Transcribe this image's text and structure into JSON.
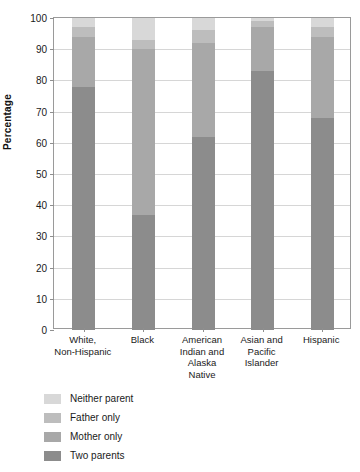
{
  "chart_data": {
    "type": "bar",
    "subtype": "stacked-bar",
    "title": "",
    "xlabel": "",
    "ylabel": "Percentage",
    "ylim": [
      0,
      100
    ],
    "ytick_step": 10,
    "yticks": [
      0,
      10,
      20,
      30,
      40,
      50,
      60,
      70,
      80,
      90,
      100
    ],
    "grid": true,
    "legend_position": "below-left",
    "stack_order_bottom_to_top": [
      "Two parents",
      "Mother only",
      "Father only",
      "Neither parent"
    ],
    "categories": [
      "White,\nNon-Hispanic",
      "Black",
      "American\nIndian and\nAlaska\nNative",
      "Asian and\nPacific\nIslander",
      "Hispanic"
    ],
    "category_labels": [
      "White, Non-Hispanic",
      "Black",
      "American Indian and Alaska Native",
      "Asian and Pacific Islander",
      "Hispanic"
    ],
    "series": [
      {
        "name": "Two parents",
        "color": "#8c8c8c",
        "values": [
          78,
          37,
          62,
          83,
          68
        ]
      },
      {
        "name": "Mother only",
        "color": "#a8a8a8",
        "values": [
          16,
          53,
          30,
          14,
          26
        ]
      },
      {
        "name": "Father only",
        "color": "#bdbdbd",
        "values": [
          3,
          3,
          4,
          2,
          3
        ]
      },
      {
        "name": "Neither parent",
        "color": "#d8d8d8",
        "values": [
          3,
          7,
          4,
          1,
          3
        ]
      }
    ],
    "totals": [
      100,
      100,
      100,
      100,
      100
    ]
  },
  "axis": {
    "y_title": "Percentage",
    "y_tick_labels": [
      "100",
      "90",
      "80",
      "70",
      "60",
      "50",
      "40",
      "30",
      "20",
      "10",
      "0"
    ]
  },
  "legend": {
    "items": [
      {
        "label": "Neither parent",
        "color": "#d8d8d8"
      },
      {
        "label": "Father only",
        "color": "#bdbdbd"
      },
      {
        "label": "Mother only",
        "color": "#a8a8a8"
      },
      {
        "label": "Two parents",
        "color": "#8c8c8c"
      }
    ]
  }
}
